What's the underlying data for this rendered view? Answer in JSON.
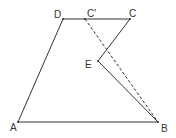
{
  "diagram": {
    "colors": {
      "line": "#333333",
      "background": "#ffffff"
    },
    "points": {
      "A": {
        "label": "A",
        "x": 18,
        "y": 122
      },
      "B": {
        "label": "B",
        "x": 158,
        "y": 122
      },
      "C": {
        "label": "C",
        "x": 130,
        "y": 19
      },
      "D": {
        "label": "D",
        "x": 63,
        "y": 19
      },
      "E": {
        "label": "E",
        "x": 98,
        "y": 61
      },
      "C_prime": {
        "label": "C'",
        "x": 85,
        "y": 19
      }
    },
    "segments": [
      {
        "from": "A",
        "to": "B",
        "style": "solid"
      },
      {
        "from": "A",
        "to": "D",
        "style": "solid"
      },
      {
        "from": "D",
        "to": "C",
        "style": "solid"
      },
      {
        "from": "C",
        "to": "E",
        "style": "solid"
      },
      {
        "from": "E",
        "to": "B",
        "style": "solid"
      },
      {
        "from": "C'",
        "to": "B",
        "style": "dashed"
      }
    ]
  }
}
